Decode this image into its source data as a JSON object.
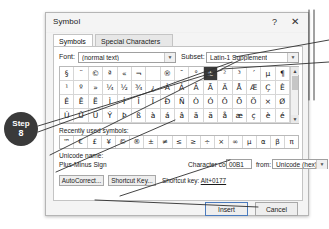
{
  "dialog": {
    "title": "Symbol",
    "help_btn": "?",
    "close_btn": "✕",
    "tabs": [
      {
        "label": "Symbols",
        "active": true
      },
      {
        "label": "Special Characters",
        "active": false
      }
    ]
  },
  "font_row": {
    "font_label": "Font:",
    "font_value": "(normal text)",
    "subset_label": "Subset:",
    "subset_value": "Latin-1 Supplement",
    "dropdown_arrow": "▼"
  },
  "grid": {
    "rows": [
      [
        "§",
        "¨",
        "©",
        "ª",
        "«",
        "¬",
        "­",
        "®",
        "¯",
        "°",
        "±",
        "²",
        "³",
        "´",
        "µ",
        "¶"
      ],
      [
        "¹",
        "º",
        "»",
        "¼",
        "½",
        "¾",
        "¿",
        "À",
        "Á",
        "Â",
        "Ã",
        "Ä",
        "Å",
        "Æ",
        "Ç",
        "È"
      ],
      [
        "É",
        "Ê",
        "Ë",
        "Ì",
        "Í",
        "Î",
        "Ï",
        "Ð",
        "Ñ",
        "Ò",
        "Ó",
        "Ô",
        "Õ",
        "Ö",
        "×",
        "Ø"
      ],
      [
        "Ú",
        "Û",
        "Ü",
        "Ý",
        "Þ",
        "ß",
        "à",
        "á",
        "â",
        "ã",
        "ä",
        "å",
        "æ",
        "ç",
        "è",
        "é"
      ]
    ],
    "selected": {
      "row": 0,
      "col": 10,
      "char": "±"
    },
    "scroll_up": "▲",
    "scroll_down": "▼"
  },
  "recent": {
    "label": "Recently used symbols:",
    "symbols": [
      "™",
      "€",
      "£",
      "¥",
      "©",
      "®",
      "±",
      "≠",
      "≤",
      "≥",
      "÷",
      "×",
      "∞",
      "µ",
      "α",
      "β",
      "π"
    ]
  },
  "info": {
    "unicode_name_label": "Unicode name:",
    "unicode_name_value": "Plus-Minus Sign",
    "char_code_label": "Character code:",
    "char_code_value": "00B1",
    "from_label": "from:",
    "from_value": "Unicode (hex)"
  },
  "panel_buttons": {
    "autocorrect": "AutoCorrect...",
    "shortcut_key": "Shortcut Key...",
    "shortcut_text_prefix": "Shortcut key: ",
    "shortcut_text_value": "Alt+0177"
  },
  "footer": {
    "insert": "Insert",
    "cancel": "Cancel"
  },
  "annotation": {
    "step_word": "Step",
    "step_number": "8"
  }
}
